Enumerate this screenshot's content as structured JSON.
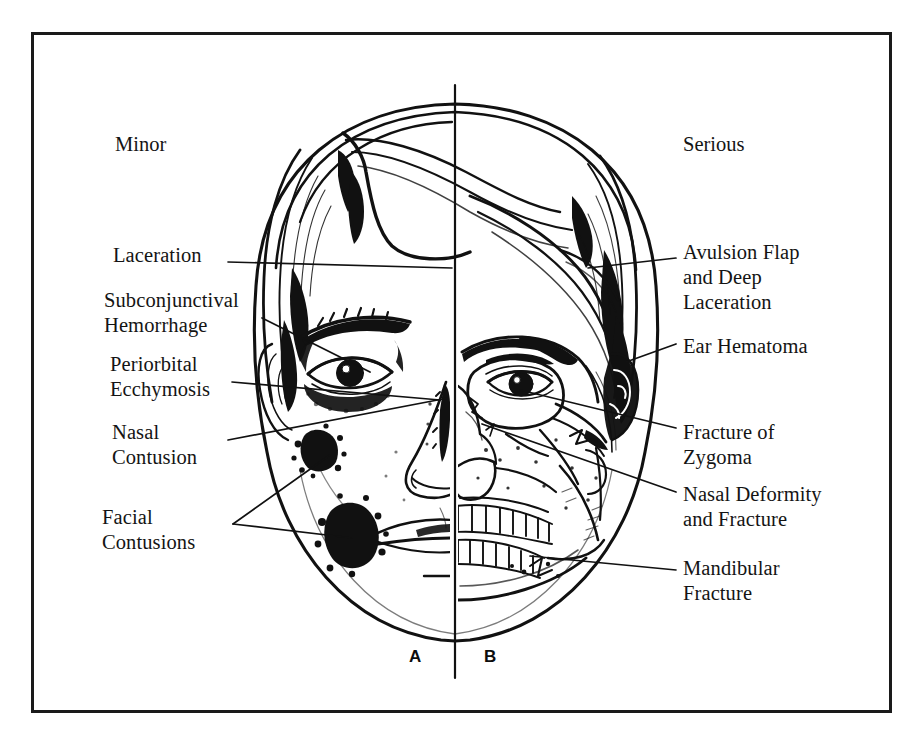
{
  "figure": {
    "border_color": "#1a1a1a",
    "ink_color": "#111111",
    "background_color": "#ffffff"
  },
  "headers": {
    "left": "Minor",
    "right": "Serious"
  },
  "panel_keys": {
    "left": "A",
    "right": "B"
  },
  "labels": {
    "left": [
      {
        "id": "laceration",
        "text": "Laceration"
      },
      {
        "id": "subconjunctival",
        "text": "Subconjunctival\nHemorrhage"
      },
      {
        "id": "periorbital",
        "text": "Periorbital\nEcchymosis"
      },
      {
        "id": "nasal_contusion",
        "text": "Nasal\nContusion"
      },
      {
        "id": "facial_contusions",
        "text": "Facial\nContusions"
      }
    ],
    "right": [
      {
        "id": "avulsion_flap",
        "text": "Avulsion Flap\nand Deep\nLaceration"
      },
      {
        "id": "ear_hematoma",
        "text": "Ear Hematoma"
      },
      {
        "id": "zygoma",
        "text": "Fracture of\nZygoma"
      },
      {
        "id": "nasal_deformity",
        "text": "Nasal Deformity\nand Fracture"
      },
      {
        "id": "mandibular",
        "text": "Mandibular\nFracture"
      }
    ]
  },
  "diagram": {
    "type": "anatomical-illustration",
    "left_half": "intact soft-tissue face with minor injuries",
    "right_half": "skull / bone anatomy with serious fractures",
    "midline": "vertical divider line through center of face"
  }
}
